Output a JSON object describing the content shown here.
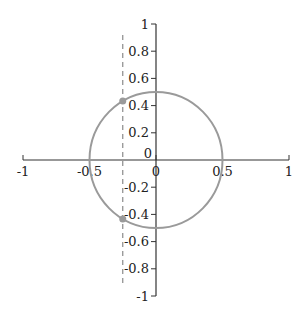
{
  "chart_data": {
    "type": "scatter",
    "title": "",
    "xlabel": "",
    "ylabel": "",
    "xlim": [
      -1,
      1
    ],
    "ylim": [
      -1,
      1
    ],
    "grid": false,
    "legend": null,
    "x_ticks": [
      {
        "value": -1,
        "label": "-1"
      },
      {
        "value": -0.5,
        "label": "-0.5"
      },
      {
        "value": 0,
        "label": "0"
      },
      {
        "value": 0.5,
        "label": "0.5"
      },
      {
        "value": 1,
        "label": "1"
      }
    ],
    "y_ticks": [
      {
        "value": 1,
        "label": "1"
      },
      {
        "value": 0.8,
        "label": "0.8"
      },
      {
        "value": 0.6,
        "label": "0.6"
      },
      {
        "value": 0.4,
        "label": "0.4"
      },
      {
        "value": 0.2,
        "label": "0.2"
      },
      {
        "value": 0,
        "label": "0"
      },
      {
        "value": -0.2,
        "label": "-0.2"
      },
      {
        "value": -0.4,
        "label": "-0.4"
      },
      {
        "value": -0.6,
        "label": "-0.6"
      },
      {
        "value": -0.8,
        "label": "-0.8"
      },
      {
        "value": -1,
        "label": "-1"
      }
    ],
    "series": [
      {
        "name": "circle",
        "kind": "curve",
        "center": [
          0,
          0
        ],
        "radius": 0.5,
        "color": "#9a9a9a"
      },
      {
        "name": "vertical line",
        "kind": "dashed-line",
        "x": -0.25,
        "y_range": [
          -0.92,
          0.92
        ],
        "color": "#8a8a8a"
      },
      {
        "name": "intersection points",
        "kind": "points",
        "points": [
          [
            -0.25,
            0.433
          ],
          [
            -0.25,
            -0.433
          ]
        ],
        "color": "#9a9a9a"
      }
    ]
  },
  "colors": {
    "axis": "#333333",
    "circle": "#9a9a9a",
    "dashed": "#8a8a8a",
    "points": "#9a9a9a"
  }
}
